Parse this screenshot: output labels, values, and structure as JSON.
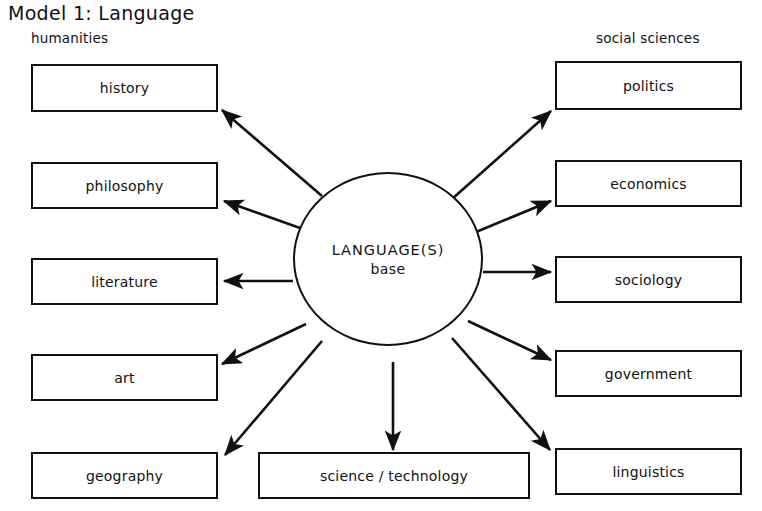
{
  "title": "Model 1: Language",
  "groups": {
    "left_label": "humanities",
    "right_label": "social sciences"
  },
  "hub": {
    "line1": "LANGUAGE(S)",
    "line2": "base"
  },
  "colors": {
    "stroke": "#111111",
    "background": "#ffffff",
    "text": "#111111"
  },
  "nodes": {
    "left": [
      {
        "id": "history",
        "label": "history",
        "x": 31,
        "y": 64,
        "w": 187,
        "h": 48
      },
      {
        "id": "philosophy",
        "label": "philosophy",
        "x": 31,
        "y": 162,
        "w": 187,
        "h": 47
      },
      {
        "id": "literature",
        "label": "literature",
        "x": 31,
        "y": 258,
        "w": 187,
        "h": 47
      },
      {
        "id": "art",
        "label": "art",
        "x": 31,
        "y": 354,
        "w": 187,
        "h": 47
      },
      {
        "id": "geography",
        "label": "geography",
        "x": 31,
        "y": 452,
        "w": 187,
        "h": 47
      }
    ],
    "right": [
      {
        "id": "politics",
        "label": "politics",
        "x": 555,
        "y": 61,
        "w": 187,
        "h": 49
      },
      {
        "id": "economics",
        "label": "economics",
        "x": 555,
        "y": 160,
        "w": 187,
        "h": 47
      },
      {
        "id": "sociology",
        "label": "sociology",
        "x": 555,
        "y": 256,
        "w": 187,
        "h": 47
      },
      {
        "id": "government",
        "label": "government",
        "x": 555,
        "y": 350,
        "w": 187,
        "h": 47
      },
      {
        "id": "linguistics",
        "label": "linguistics",
        "x": 555,
        "y": 448,
        "w": 187,
        "h": 47
      }
    ],
    "bottom": [
      {
        "id": "science-technology",
        "label": "science / technology",
        "x": 258,
        "y": 452,
        "w": 272,
        "h": 47
      }
    ]
  },
  "hub_geometry": {
    "cx": 388,
    "cy": 267,
    "r": 95
  },
  "arrows": [
    {
      "id": "arrow-to-history",
      "from": [
        322,
        196
      ],
      "to": [
        222,
        110
      ]
    },
    {
      "id": "arrow-to-philosophy",
      "from": [
        300,
        228
      ],
      "to": [
        224,
        201
      ]
    },
    {
      "id": "arrow-to-literature",
      "from": [
        293,
        281
      ],
      "to": [
        224,
        281
      ]
    },
    {
      "id": "arrow-to-art",
      "from": [
        306,
        324
      ],
      "to": [
        222,
        364
      ]
    },
    {
      "id": "arrow-to-geography",
      "from": [
        322,
        341
      ],
      "to": [
        225,
        455
      ]
    },
    {
      "id": "arrow-to-science",
      "from": [
        393,
        362
      ],
      "to": [
        393,
        450
      ]
    },
    {
      "id": "arrow-to-politics",
      "from": [
        452,
        199
      ],
      "to": [
        551,
        111
      ]
    },
    {
      "id": "arrow-to-economics",
      "from": [
        476,
        232
      ],
      "to": [
        551,
        201
      ]
    },
    {
      "id": "arrow-to-sociology",
      "from": [
        483,
        272
      ],
      "to": [
        551,
        272
      ]
    },
    {
      "id": "arrow-to-government",
      "from": [
        468,
        321
      ],
      "to": [
        551,
        360
      ]
    },
    {
      "id": "arrow-to-linguistics",
      "from": [
        452,
        338
      ],
      "to": [
        550,
        450
      ]
    }
  ]
}
